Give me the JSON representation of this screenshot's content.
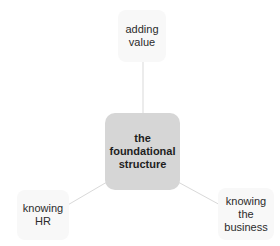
{
  "diagram": {
    "type": "hub-and-spoke",
    "center": {
      "label": "the\nfoundational\nstructure"
    },
    "satellites": [
      {
        "id": "top",
        "label": "adding\nvalue"
      },
      {
        "id": "bottom-left",
        "label": "knowing\nHR"
      },
      {
        "id": "bottom-right",
        "label": "knowing\nthe\nbusiness"
      }
    ],
    "colors": {
      "center_fill": "#d6d6d6",
      "satellite_fill": "#f8f8f8",
      "connector": "#d9d9d9",
      "text": "#2b2b2b"
    }
  }
}
